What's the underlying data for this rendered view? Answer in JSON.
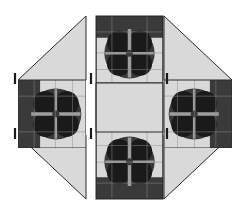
{
  "canvas": {
    "width": 250,
    "height": 215,
    "background": "#ffffff"
  },
  "palette": {
    "background": "#ffffff",
    "light_fill": "#d9d9d9",
    "mid_fill": "#9e9e9e",
    "dark_fill": "#3a3a3a",
    "black_fill": "#1a1a1a",
    "outline": "#2b2b2b",
    "grid_line": "#8c8c8c",
    "tick_mark": "#1a1a1a"
  },
  "figure": {
    "kind": "quilt-block-assembly-diagram",
    "panel_count": 5,
    "motif_count": 4
  },
  "panels": [
    {
      "id": "left-wing",
      "name": "left-wing-panel",
      "x": 18,
      "y": 16,
      "width": 68,
      "height": 183,
      "shapes": [
        {
          "type": "triangle",
          "name": "left-top-triangle",
          "points": "18,80 86,16 86,80",
          "fill": "light_fill"
        },
        {
          "type": "triangle",
          "name": "left-bottom-triangle",
          "points": "18,135 86,135 86,199",
          "fill": "light_fill"
        },
        {
          "type": "square",
          "name": "left-center-square",
          "x": 18,
          "y": 80,
          "size": 68
        }
      ]
    },
    {
      "id": "center-column",
      "name": "center-column-panel",
      "x": 96,
      "y": 16,
      "width": 67,
      "height": 183,
      "shapes": [
        {
          "type": "square",
          "name": "center-top-square",
          "x": 96,
          "y": 16,
          "size": 67
        },
        {
          "type": "square",
          "name": "center-middle-square",
          "x": 96,
          "y": 83,
          "size": 67,
          "fill": "light_fill"
        },
        {
          "type": "square",
          "name": "center-bottom-square",
          "x": 96,
          "y": 132,
          "size": 67
        }
      ]
    },
    {
      "id": "right-wing",
      "name": "right-wing-panel",
      "x": 164,
      "y": 16,
      "width": 68,
      "height": 183,
      "shapes": [
        {
          "type": "triangle",
          "name": "right-top-triangle",
          "points": "164,16 232,80 164,80",
          "fill": "light_fill"
        },
        {
          "type": "triangle",
          "name": "right-bottom-triangle",
          "points": "164,135 232,135 164,199",
          "fill": "light_fill"
        },
        {
          "type": "square",
          "name": "right-center-square",
          "x": 164,
          "y": 80,
          "size": 68
        }
      ]
    }
  ],
  "motifs": [
    {
      "id": "motif-top",
      "name": "flower-motif-top",
      "orientation": "chevron-down",
      "rotation_deg": 0,
      "cx": 129.5,
      "cy": 50
    },
    {
      "id": "motif-left",
      "name": "flower-motif-left",
      "orientation": "chevron-right",
      "rotation_deg": 270,
      "cx": 52,
      "cy": 114
    },
    {
      "id": "motif-right",
      "name": "flower-motif-right",
      "orientation": "chevron-left",
      "rotation_deg": 90,
      "cx": 198,
      "cy": 114
    },
    {
      "id": "motif-bottom",
      "name": "flower-motif-bottom",
      "orientation": "chevron-up",
      "rotation_deg": 180,
      "cx": 129.5,
      "cy": 165
    }
  ],
  "tick_marks": [
    {
      "name": "registration-tick-left-upper",
      "x": 15,
      "y": 73
    },
    {
      "name": "registration-tick-left-lower",
      "x": 15,
      "y": 128
    },
    {
      "name": "registration-tick-center-upper",
      "x": 91,
      "y": 73
    },
    {
      "name": "registration-tick-center-lower",
      "x": 91,
      "y": 128
    },
    {
      "name": "registration-tick-right-upper",
      "x": 167,
      "y": 73
    },
    {
      "name": "registration-tick-right-lower",
      "x": 167,
      "y": 128
    }
  ]
}
